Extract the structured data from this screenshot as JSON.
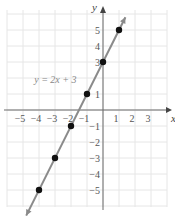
{
  "chart_data": {
    "type": "line",
    "title": "",
    "xlabel": "x",
    "ylabel": "y",
    "xlim": [
      -6,
      4
    ],
    "ylim": [
      -6,
      6
    ],
    "grid": true,
    "x_ticks": [
      -5,
      -4,
      -3,
      -2,
      -1,
      1,
      2,
      3
    ],
    "y_ticks": [
      -5,
      -4,
      -3,
      -2,
      -1,
      1,
      3,
      4,
      5
    ],
    "x_tick_labels": [
      "−5",
      "−4",
      "−3",
      "−2",
      "−1",
      "1",
      "2",
      "3"
    ],
    "y_tick_labels": [
      "−5",
      "−4",
      "−3",
      "−2",
      "−1",
      "1",
      "3",
      "4",
      "5"
    ],
    "series": [
      {
        "name": "y = 2x + 3",
        "equation": "y = 2x + 3",
        "slope": 2,
        "intercept": 3,
        "points": [
          {
            "x": -4,
            "y": -5
          },
          {
            "x": -3,
            "y": -3
          },
          {
            "x": -2,
            "y": -1
          },
          {
            "x": -1,
            "y": 1
          },
          {
            "x": 0,
            "y": 3
          },
          {
            "x": 1,
            "y": 5
          }
        ],
        "line_color": "#8a8a8a",
        "point_color": "#111111"
      }
    ],
    "annotations": [
      {
        "text": "y = 2x + 3",
        "at": {
          "x": -4.3,
          "y": 1.7
        }
      }
    ]
  },
  "labels": {
    "x_axis": "x",
    "y_axis": "y",
    "equation": "y = 2x + 3"
  }
}
